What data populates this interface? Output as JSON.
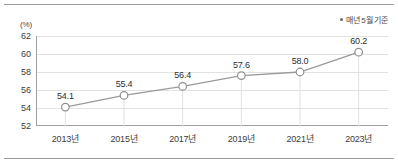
{
  "chart_data": {
    "type": "line",
    "title": "",
    "xlabel": "",
    "ylabel": "(%)",
    "unit_label": "(%)",
    "categories": [
      "2013년",
      "2015년",
      "2017년",
      "2019년",
      "2021년",
      "2023년"
    ],
    "values": [
      54.1,
      55.4,
      56.4,
      57.6,
      58.0,
      60.2
    ],
    "point_labels": [
      "54.1",
      "55.4",
      "56.4",
      "57.6",
      "58.0",
      "60.2"
    ],
    "ylim": [
      52,
      62
    ],
    "yticks": [
      52,
      54,
      56,
      58,
      60,
      62
    ],
    "ytick_labels": [
      "52",
      "54",
      "56",
      "58",
      "60",
      "62"
    ],
    "grid": true,
    "legend_position": "top-right",
    "annotations": [
      "매년 5월 기준"
    ],
    "series": [
      {
        "name": "",
        "values": [
          54.1,
          55.4,
          56.4,
          57.6,
          58.0,
          60.2
        ]
      }
    ]
  },
  "legend": {
    "marker": "dot-marker",
    "note": "매년 5월 기준"
  },
  "colors": {
    "line": "#9a9a9a",
    "marker_stroke": "#8f8f8f",
    "marker_fill": "#ffffff",
    "gridline": "#e2e2e2",
    "axis": "#9e9e9e",
    "text": "#3c3c3c",
    "rule": "#9a9a9a"
  }
}
